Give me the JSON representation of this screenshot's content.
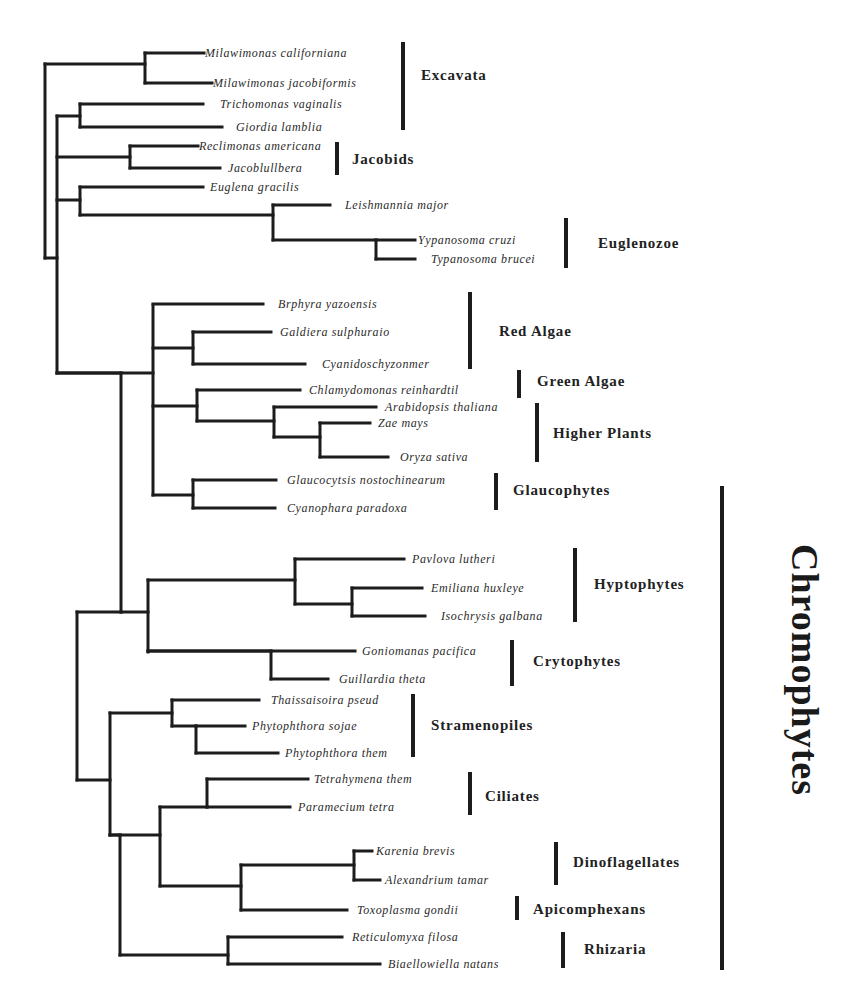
{
  "figure": {
    "line_color": "#1c1c1c",
    "background": "#ffffff"
  },
  "leaves": [
    {
      "name": "Milawimonas californiana",
      "x": 205,
      "y": 53,
      "tip": 204
    },
    {
      "name": "Milawimonas jacobiformis",
      "x": 213,
      "y": 83,
      "tip": 212
    },
    {
      "name": "Trichomonas vaginalis",
      "x": 220,
      "y": 104,
      "tip": 203
    },
    {
      "name": "Giordia lamblia",
      "x": 236,
      "y": 127,
      "tip": 222
    },
    {
      "name": "Reclimonas americana",
      "x": 199,
      "y": 146,
      "tip": 198
    },
    {
      "name": "Jacoblullbera",
      "x": 228,
      "y": 168,
      "tip": 220
    },
    {
      "name": "Euglena gracilis",
      "x": 210,
      "y": 187,
      "tip": 203
    },
    {
      "name": "Leishmannia major",
      "x": 345,
      "y": 205,
      "tip": 330
    },
    {
      "name": "Yypanosoma cruzi",
      "x": 418,
      "y": 240,
      "tip": 415
    },
    {
      "name": "Typanosoma brucei",
      "x": 431,
      "y": 259,
      "tip": 415
    },
    {
      "name": "Brphyra yazoensis",
      "x": 278,
      "y": 304,
      "tip": 263
    },
    {
      "name": "Galdiera sulphuraio",
      "x": 280,
      "y": 332,
      "tip": 271
    },
    {
      "name": "Cyanidoschyzonmer",
      "x": 322,
      "y": 364,
      "tip": 305
    },
    {
      "name": "Chlamydomonas reinhardtil",
      "x": 309,
      "y": 390,
      "tip": 300
    },
    {
      "name": "Arabidopsis thaliana",
      "x": 385,
      "y": 407,
      "tip": 376
    },
    {
      "name": "Zae mays",
      "x": 378,
      "y": 423,
      "tip": 370
    },
    {
      "name": "Oryza sativa",
      "x": 400,
      "y": 457,
      "tip": 388
    },
    {
      "name": "Glaucocytsis nostochinearum",
      "x": 287,
      "y": 480,
      "tip": 276
    },
    {
      "name": "Cyanophara paradoxa",
      "x": 287,
      "y": 508,
      "tip": 275
    },
    {
      "name": "Pavlova lutheri",
      "x": 412,
      "y": 559,
      "tip": 404
    },
    {
      "name": "Emiliana huxleye",
      "x": 431,
      "y": 588,
      "tip": 422
    },
    {
      "name": "Isochrysis galbana",
      "x": 441,
      "y": 616,
      "tip": 425
    },
    {
      "name": "Goniomanas pacifica",
      "x": 362,
      "y": 651,
      "tip": 355
    },
    {
      "name": "Guillardia theta",
      "x": 339,
      "y": 679,
      "tip": 328
    },
    {
      "name": "Thaissaisoira pseud",
      "x": 271,
      "y": 700,
      "tip": 259
    },
    {
      "name": "Phytophthora sojae",
      "x": 252,
      "y": 726,
      "tip": 245
    },
    {
      "name": "Phytophthora them",
      "x": 285,
      "y": 753,
      "tip": 278
    },
    {
      "name": "Tetrahymena them",
      "x": 314,
      "y": 779,
      "tip": 308
    },
    {
      "name": "Paramecium tetra",
      "x": 298,
      "y": 807,
      "tip": 290
    },
    {
      "name": "Karenia brevis",
      "x": 376,
      "y": 851,
      "tip": 372
    },
    {
      "name": "Alexandrium tamar",
      "x": 385,
      "y": 880,
      "tip": 380
    },
    {
      "name": "Toxoplasma gondii",
      "x": 357,
      "y": 910,
      "tip": 347
    },
    {
      "name": "Reticulomyxa filosa",
      "x": 352,
      "y": 937,
      "tip": 342
    },
    {
      "name": "Biaellowiella natans",
      "x": 388,
      "y": 964,
      "tip": 380
    }
  ],
  "internal_nodes": [
    {
      "x": 45,
      "y1": 64,
      "y2": 258,
      "parent_x": null
    },
    {
      "x": 145,
      "y1": 53,
      "y2": 83,
      "parent_x": 45,
      "join_y": 64
    },
    {
      "x": 57,
      "y1": 116,
      "y2": 373,
      "parent_x": 45,
      "join_y": 258
    },
    {
      "x": 80,
      "y1": 104,
      "y2": 127,
      "parent_x": 57,
      "join_y": 116
    },
    {
      "x": 130,
      "y1": 146,
      "y2": 168,
      "parent_x": 57,
      "join_y": 157
    },
    {
      "x": 80,
      "y1": 187,
      "y2": 215,
      "parent_x": 57,
      "join_y": 200
    },
    {
      "x": 273,
      "y1": 205,
      "y2": 240,
      "parent_x": 80,
      "join_y": 215
    },
    {
      "x": 376,
      "y1": 240,
      "y2": 259,
      "parent_x": 273,
      "join_y": 240
    },
    {
      "x": 153,
      "y1": 305,
      "y2": 495,
      "parent_x": 57,
      "join_y": 373
    },
    {
      "x": 193,
      "y1": 332,
      "y2": 364,
      "parent_x": 153,
      "join_y": 348
    },
    {
      "x": 197,
      "y1": 390,
      "y2": 421,
      "parent_x": 153,
      "join_y": 406
    },
    {
      "x": 274,
      "y1": 407,
      "y2": 437,
      "parent_x": 197,
      "join_y": 421
    },
    {
      "x": 320,
      "y1": 423,
      "y2": 457,
      "parent_x": 274,
      "join_y": 437
    },
    {
      "x": 193,
      "y1": 480,
      "y2": 508,
      "parent_x": 153,
      "join_y": 495
    },
    {
      "x": 121,
      "y1": 373,
      "y2": 612,
      "parent_x": 57,
      "join_y": 373
    },
    {
      "x": 77,
      "y1": 612,
      "y2": 780,
      "parent_x": 121,
      "join_y": 612
    },
    {
      "x": 148,
      "y1": 580,
      "y2": 652,
      "parent_x": 121,
      "join_y": 612
    },
    {
      "x": 295,
      "y1": 559,
      "y2": 604,
      "parent_x": 148,
      "join_y": 580
    },
    {
      "x": 352,
      "y1": 588,
      "y2": 616,
      "parent_x": 295,
      "join_y": 604
    },
    {
      "x": 271,
      "y1": 651,
      "y2": 679,
      "parent_x": 148,
      "join_y": 651
    },
    {
      "x": 110,
      "y1": 713,
      "y2": 835,
      "parent_x": 77,
      "join_y": 780
    },
    {
      "x": 172,
      "y1": 700,
      "y2": 726,
      "parent_x": 110,
      "join_y": 713
    },
    {
      "x": 196,
      "y1": 726,
      "y2": 753,
      "parent_x": 172,
      "join_y": 726
    },
    {
      "x": 160,
      "y1": 807,
      "y2": 886,
      "parent_x": 110,
      "join_y": 835
    },
    {
      "x": 207,
      "y1": 779,
      "y2": 807,
      "parent_x": 160,
      "join_y": 807
    },
    {
      "x": 241,
      "y1": 865,
      "y2": 910,
      "parent_x": 160,
      "join_y": 886
    },
    {
      "x": 354,
      "y1": 851,
      "y2": 880,
      "parent_x": 241,
      "join_y": 865
    },
    {
      "x": 120,
      "y1": 835,
      "y2": 955,
      "parent_x": 110,
      "join_y": 835
    },
    {
      "x": 228,
      "y1": 937,
      "y2": 964,
      "parent_x": 120,
      "join_y": 955
    }
  ],
  "leaf_edges": [
    {
      "from_x": 145,
      "leaf": 0
    },
    {
      "from_x": 145,
      "leaf": 1
    },
    {
      "from_x": 80,
      "leaf": 2
    },
    {
      "from_x": 80,
      "leaf": 3
    },
    {
      "from_x": 130,
      "leaf": 4
    },
    {
      "from_x": 130,
      "leaf": 5
    },
    {
      "from_x": 80,
      "leaf": 6
    },
    {
      "from_x": 273,
      "leaf": 7
    },
    {
      "from_x": 376,
      "leaf": 8
    },
    {
      "from_x": 376,
      "leaf": 9
    },
    {
      "from_x": 153,
      "leaf": 10
    },
    {
      "from_x": 193,
      "leaf": 11
    },
    {
      "from_x": 193,
      "leaf": 12
    },
    {
      "from_x": 197,
      "leaf": 13
    },
    {
      "from_x": 274,
      "leaf": 14
    },
    {
      "from_x": 320,
      "leaf": 15
    },
    {
      "from_x": 320,
      "leaf": 16
    },
    {
      "from_x": 193,
      "leaf": 17
    },
    {
      "from_x": 193,
      "leaf": 18
    },
    {
      "from_x": 295,
      "leaf": 19
    },
    {
      "from_x": 352,
      "leaf": 20
    },
    {
      "from_x": 352,
      "leaf": 21
    },
    {
      "from_x": 148,
      "leaf": 22
    },
    {
      "from_x": 271,
      "leaf": 23
    },
    {
      "from_x": 172,
      "leaf": 24
    },
    {
      "from_x": 196,
      "leaf": 25
    },
    {
      "from_x": 196,
      "leaf": 26
    },
    {
      "from_x": 207,
      "leaf": 27
    },
    {
      "from_x": 207,
      "leaf": 28
    },
    {
      "from_x": 354,
      "leaf": 29
    },
    {
      "from_x": 354,
      "leaf": 30
    },
    {
      "from_x": 241,
      "leaf": 31
    },
    {
      "from_x": 228,
      "leaf": 32
    },
    {
      "from_x": 228,
      "leaf": 33
    }
  ],
  "groups": [
    {
      "label": "Excavata",
      "bar_x": 403,
      "bar_y1": 42,
      "bar_y2": 130,
      "label_x": 421,
      "label_y": 80
    },
    {
      "label": "Jacobids",
      "bar_x": 337,
      "bar_y1": 142,
      "bar_y2": 175,
      "label_x": 352,
      "label_y": 164
    },
    {
      "label": "Euglenozoe",
      "bar_x": 566,
      "bar_y1": 218,
      "bar_y2": 268,
      "label_x": 598,
      "label_y": 248
    },
    {
      "label": "Red Algae",
      "bar_x": 470,
      "bar_y1": 292,
      "bar_y2": 369,
      "label_x": 499,
      "label_y": 336
    },
    {
      "label": "Green Algae",
      "bar_x": 519,
      "bar_y1": 370,
      "bar_y2": 398,
      "label_x": 537,
      "label_y": 386
    },
    {
      "label": "Higher Plants",
      "bar_x": 537,
      "bar_y1": 403,
      "bar_y2": 462,
      "label_x": 553,
      "label_y": 438
    },
    {
      "label": "Glaucophytes",
      "bar_x": 496,
      "bar_y1": 473,
      "bar_y2": 510,
      "label_x": 513,
      "label_y": 495
    },
    {
      "label": "Hyptophytes",
      "bar_x": 575,
      "bar_y1": 548,
      "bar_y2": 622,
      "label_x": 594,
      "label_y": 589
    },
    {
      "label": "Crytophytes",
      "bar_x": 512,
      "bar_y1": 640,
      "bar_y2": 686,
      "label_x": 533,
      "label_y": 666
    },
    {
      "label": "Stramenopiles",
      "bar_x": 413,
      "bar_y1": 694,
      "bar_y2": 757,
      "label_x": 431,
      "label_y": 730
    },
    {
      "label": "Ciliates",
      "bar_x": 470,
      "bar_y1": 772,
      "bar_y2": 815,
      "label_x": 485,
      "label_y": 801
    },
    {
      "label": "Dinoflagellates",
      "bar_x": 556,
      "bar_y1": 842,
      "bar_y2": 885,
      "label_x": 573,
      "label_y": 867
    },
    {
      "label": "Apicomphexans",
      "bar_x": 517,
      "bar_y1": 896,
      "bar_y2": 920,
      "label_x": 533,
      "label_y": 914
    },
    {
      "label": "Rhizaria",
      "bar_x": 563,
      "bar_y1": 932,
      "bar_y2": 968,
      "label_x": 584,
      "label_y": 954
    }
  ],
  "supergroup": {
    "label": "Chromophytes",
    "bar_x": 722,
    "bar_y1": 486,
    "bar_y2": 970,
    "label_x": 805,
    "label_y": 670
  }
}
